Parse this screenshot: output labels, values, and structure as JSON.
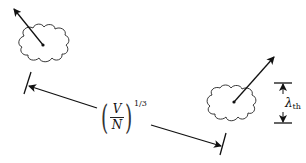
{
  "diagram": {
    "spacing_label": {
      "numerator": "V",
      "denominator": "N",
      "exponent": "1/3"
    },
    "wavelength_label": {
      "symbol": "λ",
      "subscript": "th"
    },
    "colors": {
      "stroke": "#111111",
      "background": "#ffffff"
    },
    "elements": [
      {
        "name": "left-wavepacket",
        "center": [
          43,
          45
        ]
      },
      {
        "name": "right-wavepacket",
        "center": [
          234,
          102
        ]
      }
    ]
  }
}
